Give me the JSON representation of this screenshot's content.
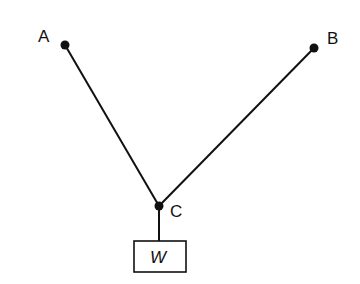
{
  "diagram": {
    "title": "",
    "points": [
      {
        "id": "A",
        "label": "A",
        "x": 65,
        "y": 45
      },
      {
        "id": "B",
        "label": "B",
        "x": 314,
        "y": 48
      },
      {
        "id": "C",
        "label": "C",
        "x": 159,
        "y": 206
      }
    ],
    "cables": [
      {
        "from": "A",
        "to": "C"
      },
      {
        "from": "B",
        "to": "C"
      }
    ],
    "weight": {
      "label": "W",
      "hangs_from": "C"
    }
  }
}
